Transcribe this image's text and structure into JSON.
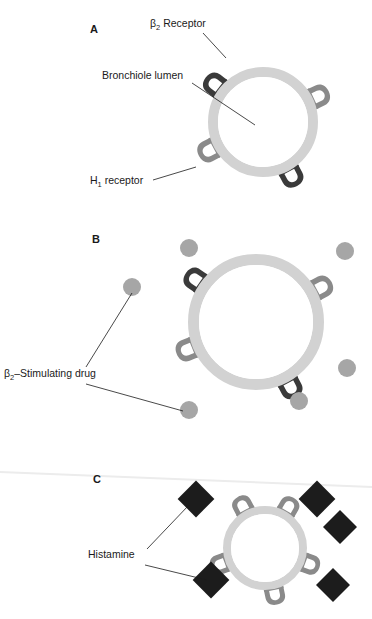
{
  "figure": {
    "background_color": "#ffffff"
  },
  "colors": {
    "ring": "#d2d2d2",
    "ring_inner": "#e6e6e6",
    "beta2_receptor": "#3a3a3a",
    "h1_receptor": "#8a8a8a",
    "drug_particle": "#a6a6a6",
    "histamine_particle": "#1c1c1c",
    "text": "#1a1a1a",
    "leader": "#1a1a1a"
  },
  "panels": [
    {
      "id": "panel-a",
      "letter": "A",
      "letter_pos": {
        "x": 90,
        "y": 33
      },
      "lumen": {
        "cx": 263,
        "cy": 122,
        "outer_r": 55,
        "inner_r": 45
      },
      "state": "normal",
      "labels": [
        {
          "name": "beta2-receptor-label",
          "text": "β2 Receptor",
          "base": "β",
          "sub": "2",
          "tail": " Receptor",
          "x": 150,
          "y": 27,
          "anchor": "start",
          "leader": {
            "x1": 203,
            "y1": 33,
            "x2": 226,
            "y2": 58
          }
        },
        {
          "name": "bronchiole-lumen-label",
          "text": "Bronchiole lumen",
          "base": "Bronchiole lumen",
          "sub": "",
          "tail": "",
          "x": 102,
          "y": 79,
          "anchor": "start",
          "leader": {
            "x1": 192,
            "y1": 83,
            "x2": 255,
            "y2": 125
          }
        },
        {
          "name": "h1-receptor-label",
          "text": "H1 receptor",
          "base": "H",
          "sub": "1",
          "tail": " receptor",
          "x": 90,
          "y": 184,
          "anchor": "start",
          "leader": {
            "x1": 153,
            "y1": 180,
            "x2": 196,
            "y2": 167
          }
        }
      ],
      "receptors": [
        {
          "name": "beta2-receptor",
          "kind": "beta2",
          "angle": 218,
          "size": 1.0
        },
        {
          "name": "h1-receptor",
          "kind": "h1",
          "angle": 335,
          "size": 1.0
        },
        {
          "name": "h1-receptor",
          "kind": "h1",
          "angle": 152,
          "size": 1.0
        },
        {
          "name": "beta2-receptor",
          "kind": "beta2",
          "angle": 62,
          "size": 1.0
        }
      ],
      "particles": []
    },
    {
      "id": "panel-b",
      "letter": "B",
      "letter_pos": {
        "x": 92,
        "y": 243
      },
      "lumen": {
        "cx": 256,
        "cy": 322,
        "outer_r": 68,
        "inner_r": 57
      },
      "state": "dilated",
      "labels": [
        {
          "name": "beta2-stimulating-drug-label",
          "text": "β2–Stimulating drug",
          "base": "β",
          "sub": "2",
          "tail": "–Stimulating drug",
          "x": 4,
          "y": 377,
          "anchor": "start",
          "leader": {
            "x1": 86,
            "y1": 367,
            "x2": 132,
            "y2": 293
          }
        }
      ],
      "leaders_extra": [
        {
          "name": "drug-leader-lower",
          "x1": 86,
          "y1": 384,
          "x2": 183,
          "y2": 411
        }
      ],
      "receptors": [
        {
          "name": "beta2-receptor-bound",
          "kind": "beta2",
          "angle": 215,
          "size": 1.0
        },
        {
          "name": "h1-receptor",
          "kind": "h1",
          "angle": 332,
          "size": 1.0
        },
        {
          "name": "h1-receptor",
          "kind": "h1",
          "angle": 158,
          "size": 1.0
        },
        {
          "name": "beta2-receptor-bound",
          "kind": "beta2",
          "angle": 62,
          "size": 1.0
        }
      ],
      "particles": [
        {
          "name": "drug-particle",
          "cx": 189,
          "cy": 248,
          "r": 9,
          "kind": "drug"
        },
        {
          "name": "drug-particle",
          "cx": 345,
          "cy": 251,
          "r": 9,
          "kind": "drug"
        },
        {
          "name": "drug-particle",
          "cx": 132,
          "cy": 287,
          "r": 9,
          "kind": "drug"
        },
        {
          "name": "drug-particle",
          "cx": 347,
          "cy": 368,
          "r": 9,
          "kind": "drug"
        },
        {
          "name": "drug-particle",
          "cx": 189,
          "cy": 410,
          "r": 9,
          "kind": "drug"
        },
        {
          "name": "drug-particle",
          "cx": 299,
          "cy": 401,
          "r": 9,
          "kind": "drug"
        }
      ]
    },
    {
      "id": "panel-c",
      "letter": "C",
      "letter_pos": {
        "x": 93,
        "y": 483
      },
      "lumen": {
        "cx": 265,
        "cy": 548,
        "outer_r": 42,
        "inner_r": 34
      },
      "state": "constricted",
      "labels": [
        {
          "name": "histamine-label",
          "text": "Histamine",
          "base": "Histamine",
          "sub": "",
          "tail": "",
          "x": 88,
          "y": 558,
          "anchor": "start",
          "leader": {
            "x1": 147,
            "y1": 549,
            "x2": 189,
            "y2": 505
          }
        }
      ],
      "leaders_extra": [
        {
          "name": "histamine-leader-lower",
          "x1": 145,
          "y1": 565,
          "x2": 207,
          "y2": 580
        }
      ],
      "receptors": [
        {
          "name": "h1-receptor-bound",
          "kind": "h1",
          "angle": 242,
          "size": 0.9
        },
        {
          "name": "h1-receptor-bound",
          "kind": "h1",
          "angle": 300,
          "size": 0.9
        },
        {
          "name": "h1-receptor-bound",
          "kind": "h1",
          "angle": 20,
          "size": 0.9
        },
        {
          "name": "h1-receptor-bound",
          "kind": "h1",
          "angle": 78,
          "size": 0.9
        },
        {
          "name": "h1-receptor-bound",
          "kind": "h1",
          "angle": 160,
          "size": 0.9
        }
      ],
      "particles": [
        {
          "name": "histamine-particle",
          "cx": 196,
          "cy": 499,
          "r": 13,
          "kind": "histamine"
        },
        {
          "name": "histamine-particle",
          "cx": 317,
          "cy": 499,
          "r": 13,
          "kind": "histamine"
        },
        {
          "name": "histamine-particle",
          "cx": 340,
          "cy": 527,
          "r": 12,
          "kind": "histamine"
        },
        {
          "name": "histamine-particle",
          "cx": 211,
          "cy": 580,
          "r": 13,
          "kind": "histamine"
        },
        {
          "name": "histamine-particle",
          "cx": 333,
          "cy": 585,
          "r": 12,
          "kind": "histamine"
        }
      ]
    }
  ],
  "scan_artifacts": [
    {
      "name": "scan-smudge-line",
      "d": "M 0 472 L 372 487"
    }
  ]
}
